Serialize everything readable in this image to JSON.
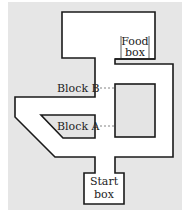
{
  "diagram": {
    "type": "maze",
    "background_color": "#e6e6e6",
    "wall_color": "#1a1a1a",
    "floor_color": "#ffffff",
    "block_fill": "#e4e4e4",
    "labels": {
      "food_box_line1": "Food",
      "food_box_line2": "box",
      "start_box_line1": "Start",
      "start_box_line2": "box",
      "block_a": "Block A",
      "block_b": "Block B"
    }
  }
}
